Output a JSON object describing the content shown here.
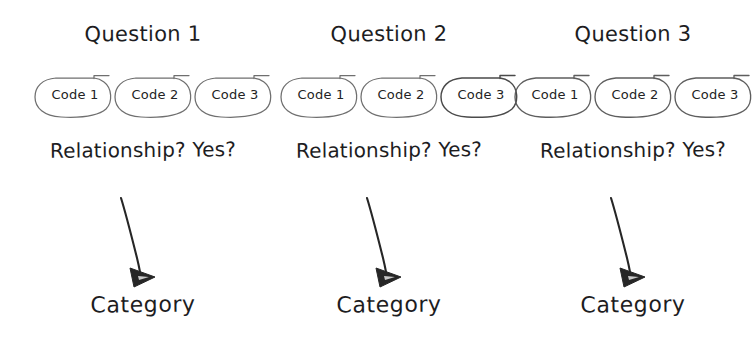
{
  "diagram": {
    "style": "hand-drawn sketch",
    "background_color": "#ffffff",
    "ink_color": "#1d1d1f",
    "bubble_outline_color": "#6f6f6f",
    "arrow_color": "#262626",
    "columns": [
      {
        "id": "question-1",
        "title": "Question 1",
        "codes": [
          {
            "label": "Code 1"
          },
          {
            "label": "Code 2"
          },
          {
            "label": "Code 3"
          }
        ],
        "prompt": "Relationship? Yes?",
        "arrow": "curved-down-right-arrow",
        "outcome": "Category"
      },
      {
        "id": "question-2",
        "title": "Question 2",
        "codes": [
          {
            "label": "Code 1"
          },
          {
            "label": "Code 2"
          },
          {
            "label": "Code 3"
          }
        ],
        "prompt": "Relationship? Yes?",
        "arrow": "curved-down-right-arrow",
        "outcome": "Category"
      },
      {
        "id": "question-3",
        "title": "Question 3",
        "codes": [
          {
            "label": "Code 1"
          },
          {
            "label": "Code 2"
          },
          {
            "label": "Code 3"
          }
        ],
        "prompt": "Relationship? Yes?",
        "arrow": "curved-down-right-arrow",
        "outcome": "Category"
      }
    ]
  }
}
